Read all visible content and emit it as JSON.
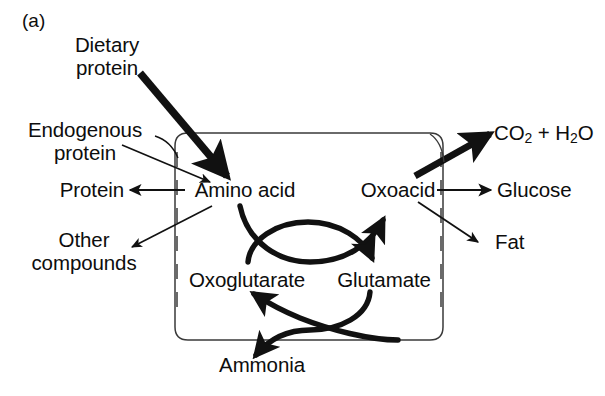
{
  "figure": {
    "panel_label": "(a)",
    "background_color": "#ffffff",
    "stroke_color": "#111111"
  },
  "nodes": {
    "dietary_protein": "Dietary\nprotein",
    "dietary_protein_line1": "Dietary",
    "dietary_protein_line2": "protein",
    "endogenous_protein_line1": "Endogenous",
    "endogenous_protein_line2": "protein",
    "protein": "Protein",
    "other_compounds_line1": "Other",
    "other_compounds_line2": "compounds",
    "amino_acid": "Amino acid",
    "oxoacid": "Oxoacid",
    "oxoglutarate": "Oxoglutarate",
    "glutamate": "Glutamate",
    "ammonia": "Ammonia",
    "co2_h2o_part1": "CO",
    "co2_h2o_sub1": "2",
    "co2_h2o_plus": " + H",
    "co2_h2o_sub2": "2",
    "co2_h2o_end": "O",
    "glucose": "Glucose",
    "fat": "Fat"
  },
  "edges": [
    {
      "name": "dietary-protein-to-amino-acid",
      "from": "Dietary protein",
      "to": "Amino acid",
      "style": "thick"
    },
    {
      "name": "endogenous-protein-to-amino-acid",
      "from": "Endogenous protein",
      "to": "Amino acid",
      "style": "thin"
    },
    {
      "name": "amino-acid-to-protein",
      "from": "Amino acid",
      "to": "Protein",
      "style": "thin"
    },
    {
      "name": "amino-acid-to-other-compounds",
      "from": "Amino acid",
      "to": "Other compounds",
      "style": "thin"
    },
    {
      "name": "amino-acid-to-oxoacid",
      "from": "Amino acid",
      "to": "Oxoacid",
      "style": "thick-curve"
    },
    {
      "name": "oxoglutarate-to-glutamate",
      "from": "Oxoglutarate",
      "to": "Glutamate",
      "style": "thick-curve"
    },
    {
      "name": "glutamate-to-ammonia",
      "from": "Glutamate",
      "to": "Ammonia",
      "style": "thick-curve"
    },
    {
      "name": "ammonia-to-oxoglutarate",
      "from": "Ammonia",
      "to": "Oxoglutarate",
      "style": "thick-curve"
    },
    {
      "name": "oxoacid-to-co2-h2o",
      "from": "Oxoacid",
      "to": "CO2 + H2O",
      "style": "thick"
    },
    {
      "name": "oxoacid-to-glucose",
      "from": "Oxoacid",
      "to": "Glucose",
      "style": "medium"
    },
    {
      "name": "oxoacid-to-fat",
      "from": "Oxoacid",
      "to": "Fat",
      "style": "thin"
    }
  ],
  "compartment": {
    "name": "cell-boundary",
    "shape": "rounded-rectangle",
    "membrane_lines": [
      "left-dashed",
      "right-dashed"
    ]
  }
}
